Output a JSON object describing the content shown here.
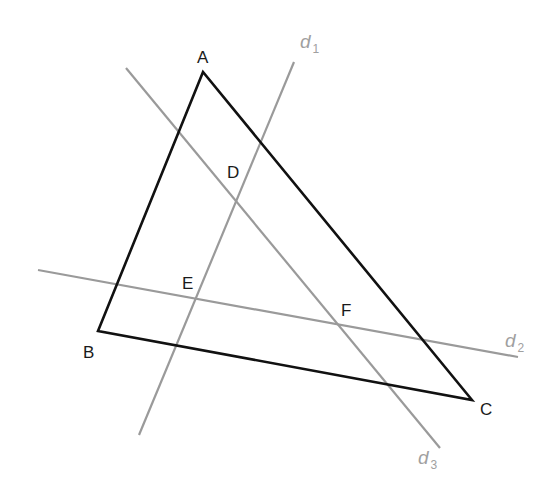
{
  "diagram": {
    "colors": {
      "triangle": "#111111",
      "lines": "#9a9a9a",
      "point_labels": "#1a1a1a",
      "line_labels": "#a0a0a0",
      "background": "#ffffff"
    },
    "vertices": [
      {
        "id": "A",
        "label": "A",
        "x": 203,
        "y": 72,
        "label_x": 197,
        "label_y": 63
      },
      {
        "id": "B",
        "label": "B",
        "x": 98,
        "y": 331,
        "label_x": 83,
        "label_y": 358
      },
      {
        "id": "C",
        "label": "C",
        "x": 472,
        "y": 400,
        "label_x": 480,
        "label_y": 415
      }
    ],
    "triangle_edges": [
      {
        "from": "A",
        "to": "B"
      },
      {
        "from": "B",
        "to": "C"
      },
      {
        "from": "C",
        "to": "A"
      }
    ],
    "lines": [
      {
        "id": "d1",
        "name": "d",
        "subscript": "1",
        "x1": 139,
        "y1": 435,
        "x2": 294,
        "y2": 62,
        "label_x": 300,
        "label_y": 48
      },
      {
        "id": "d2",
        "name": "d",
        "subscript": "2",
        "x1": 38,
        "y1": 270,
        "x2": 518,
        "y2": 357,
        "label_x": 505,
        "label_y": 347
      },
      {
        "id": "d3",
        "name": "d",
        "subscript": "3",
        "x1": 126,
        "y1": 68,
        "x2": 440,
        "y2": 448,
        "label_x": 418,
        "label_y": 464
      }
    ],
    "intersection_points": [
      {
        "id": "D",
        "label": "D",
        "lines": [
          "d1",
          "d3"
        ],
        "label_x": 227,
        "label_y": 178
      },
      {
        "id": "E",
        "label": "E",
        "lines": [
          "d1",
          "d2"
        ],
        "label_x": 182,
        "label_y": 289
      },
      {
        "id": "F",
        "label": "F",
        "lines": [
          "d2",
          "d3"
        ],
        "label_x": 341,
        "label_y": 316
      }
    ]
  }
}
